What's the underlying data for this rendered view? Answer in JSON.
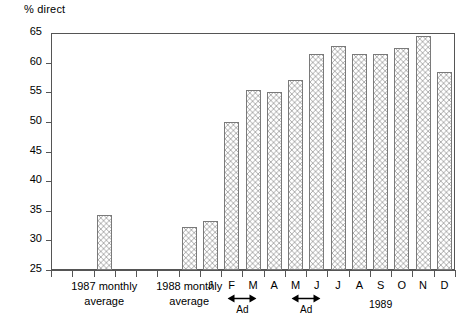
{
  "chart_data": {
    "type": "bar",
    "title": "",
    "subtitle": "",
    "xlabel": "",
    "ylabel": "% direct",
    "ylim": [
      25,
      65
    ],
    "ytick_step": 5,
    "yticks": [
      65,
      60,
      55,
      50,
      45,
      40,
      35,
      30,
      25
    ],
    "ytick_labels": [
      "65",
      "60",
      "55",
      "50",
      "45",
      "40",
      "35",
      "30",
      "25"
    ],
    "grid": false,
    "legend": null,
    "categories": [
      "1987 monthly average",
      "1988 monthly average",
      "J",
      "F",
      "M",
      "A",
      "M",
      "J",
      "J",
      "A",
      "S",
      "O",
      "N",
      "D"
    ],
    "values": [
      34.2,
      32.3,
      33.3,
      50.0,
      55.4,
      55.0,
      57.0,
      61.4,
      62.8,
      61.5,
      61.5,
      62.4,
      64.5,
      58.5
    ],
    "series": [
      {
        "name": "% direct",
        "values": [
          34.2,
          32.3,
          33.3,
          50.0,
          55.4,
          55.0,
          57.0,
          61.4,
          62.8,
          61.5,
          61.5,
          62.4,
          64.5,
          58.5
        ]
      }
    ],
    "annotations": [
      {
        "label": "Ad",
        "spans": [
          "F",
          "M"
        ]
      },
      {
        "label": "Ad",
        "spans": [
          "M",
          "J"
        ]
      },
      {
        "label": "1989",
        "spans": [
          "J",
          "D"
        ]
      }
    ],
    "colors": {
      "axis": "#555555",
      "bar_edge": "#7a7a7a",
      "bar_fill": "#ffffff",
      "bar_hatch": "#5a5a5a",
      "text": "#000000"
    }
  },
  "axis": {
    "ylabel": "% direct",
    "ytick_labels": [
      "65",
      "60",
      "55",
      "50",
      "45",
      "40",
      "35",
      "30",
      "25"
    ]
  },
  "xaxis": {
    "group_labels": [
      {
        "line1": "1987 monthly",
        "line2": "average"
      },
      {
        "line1": "1988 monthly",
        "line2": "average"
      }
    ],
    "month_labels": [
      "J",
      "F",
      "M",
      "A",
      "M",
      "J",
      "J",
      "A",
      "S",
      "O",
      "N",
      "D"
    ],
    "ad_labels": [
      "Ad",
      "Ad"
    ],
    "year_label": "1989"
  }
}
